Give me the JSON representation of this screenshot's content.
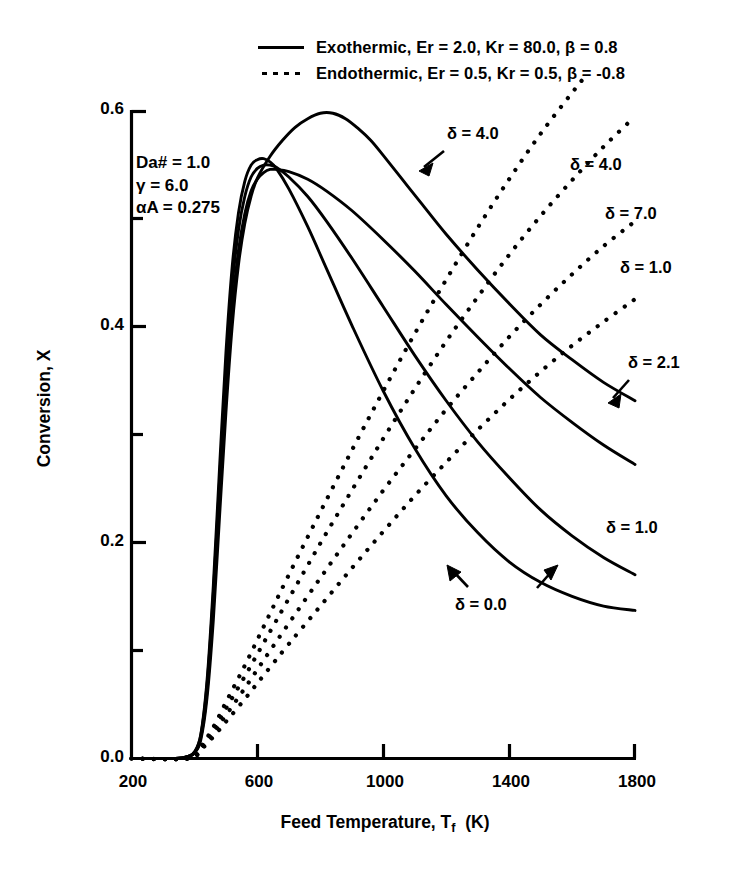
{
  "chart_data": {
    "type": "line",
    "title": "",
    "xlabel": "Feed Temperature, Tf  (K)",
    "ylabel": "Conversion, X",
    "xlim": [
      200,
      1800
    ],
    "ylim": [
      0.0,
      0.6
    ],
    "xticks": [
      200,
      600,
      1000,
      1400,
      1800
    ],
    "xtick_labels": [
      "200",
      "600",
      "1000",
      "1400",
      "1800"
    ],
    "yticks": [
      0.0,
      0.2,
      0.4,
      0.6
    ],
    "ytick_labels": [
      "0.0",
      "0.2",
      "0.4",
      "0.6"
    ],
    "yminor_ticks": [
      0.1,
      0.3,
      0.5
    ],
    "grid": false,
    "legend_position": "above-plot",
    "legend": [
      {
        "style": "solid",
        "label": "Exothermic, Er = 2.0, Kr = 80.0,  β = 0.8"
      },
      {
        "style": "dotted",
        "label": "Endothermic, Er = 0.5, Kr = 0.5, β = -0.8"
      }
    ],
    "annotations": {
      "parameters": [
        "Da# = 1.0",
        "γ = 6.0",
        "αA = 0.275"
      ],
      "curve_labels": [
        {
          "text": "δ = 4.0",
          "series": "exothermic-delta-4.0",
          "arrow": true
        },
        {
          "text": "δ = 4.0",
          "series": "endothermic-delta-4.0",
          "arrow": false
        },
        {
          "text": "δ = 7.0",
          "series": "endothermic-delta-7.0",
          "arrow": false
        },
        {
          "text": "δ = 1.0",
          "series": "endothermic-delta-1.0",
          "arrow": false
        },
        {
          "text": "δ = 2.1",
          "series": "exothermic-delta-2.1",
          "arrow": true
        },
        {
          "text": "δ = 1.0",
          "series": "exothermic-delta-1.0",
          "arrow": false
        },
        {
          "text": "δ = 0.0",
          "series": "delta-0.0",
          "arrow": true
        }
      ]
    },
    "series": [
      {
        "name": "exothermic-delta-0.0",
        "style": "solid",
        "delta": 0.0,
        "points": [
          [
            200,
            0.0
          ],
          [
            340,
            0.0
          ],
          [
            380,
            0.002
          ],
          [
            400,
            0.006
          ],
          [
            420,
            0.022
          ],
          [
            440,
            0.072
          ],
          [
            460,
            0.16
          ],
          [
            480,
            0.27
          ],
          [
            500,
            0.375
          ],
          [
            520,
            0.455
          ],
          [
            540,
            0.505
          ],
          [
            560,
            0.534
          ],
          [
            580,
            0.549
          ],
          [
            600,
            0.554
          ],
          [
            620,
            0.555
          ],
          [
            640,
            0.552
          ],
          [
            660,
            0.546
          ],
          [
            700,
            0.527
          ],
          [
            760,
            0.492
          ],
          [
            820,
            0.453
          ],
          [
            900,
            0.401
          ],
          [
            1000,
            0.34
          ],
          [
            1100,
            0.287
          ],
          [
            1200,
            0.243
          ],
          [
            1300,
            0.209
          ],
          [
            1400,
            0.182
          ],
          [
            1500,
            0.163
          ],
          [
            1600,
            0.15
          ],
          [
            1700,
            0.141
          ],
          [
            1800,
            0.137
          ]
        ]
      },
      {
        "name": "exothermic-delta-1.0",
        "style": "solid",
        "delta": 1.0,
        "points": [
          [
            200,
            0.0
          ],
          [
            340,
            0.0
          ],
          [
            380,
            0.002
          ],
          [
            400,
            0.006
          ],
          [
            420,
            0.021
          ],
          [
            440,
            0.068
          ],
          [
            460,
            0.152
          ],
          [
            480,
            0.258
          ],
          [
            500,
            0.358
          ],
          [
            520,
            0.437
          ],
          [
            540,
            0.489
          ],
          [
            560,
            0.52
          ],
          [
            580,
            0.538
          ],
          [
            600,
            0.546
          ],
          [
            620,
            0.549
          ],
          [
            640,
            0.549
          ],
          [
            660,
            0.547
          ],
          [
            700,
            0.538
          ],
          [
            760,
            0.52
          ],
          [
            820,
            0.497
          ],
          [
            900,
            0.463
          ],
          [
            1000,
            0.418
          ],
          [
            1100,
            0.373
          ],
          [
            1200,
            0.331
          ],
          [
            1300,
            0.293
          ],
          [
            1400,
            0.26
          ],
          [
            1500,
            0.23
          ],
          [
            1600,
            0.206
          ],
          [
            1700,
            0.186
          ],
          [
            1800,
            0.17
          ]
        ]
      },
      {
        "name": "exothermic-delta-2.1",
        "style": "solid",
        "delta": 2.1,
        "points": [
          [
            200,
            0.0
          ],
          [
            340,
            0.0
          ],
          [
            380,
            0.002
          ],
          [
            400,
            0.005
          ],
          [
            420,
            0.019
          ],
          [
            440,
            0.062
          ],
          [
            460,
            0.14
          ],
          [
            480,
            0.24
          ],
          [
            500,
            0.337
          ],
          [
            520,
            0.416
          ],
          [
            540,
            0.47
          ],
          [
            560,
            0.504
          ],
          [
            580,
            0.525
          ],
          [
            600,
            0.536
          ],
          [
            620,
            0.542
          ],
          [
            640,
            0.545
          ],
          [
            660,
            0.545
          ],
          [
            700,
            0.543
          ],
          [
            760,
            0.536
          ],
          [
            820,
            0.525
          ],
          [
            900,
            0.507
          ],
          [
            1000,
            0.48
          ],
          [
            1100,
            0.451
          ],
          [
            1200,
            0.42
          ],
          [
            1300,
            0.39
          ],
          [
            1400,
            0.361
          ],
          [
            1500,
            0.334
          ],
          [
            1600,
            0.311
          ],
          [
            1700,
            0.29
          ],
          [
            1800,
            0.272
          ]
        ]
      },
      {
        "name": "exothermic-delta-4.0",
        "style": "solid",
        "delta": 4.0,
        "points": [
          [
            200,
            0.0
          ],
          [
            340,
            0.0
          ],
          [
            380,
            0.002
          ],
          [
            400,
            0.005
          ],
          [
            420,
            0.017
          ],
          [
            440,
            0.056
          ],
          [
            460,
            0.128
          ],
          [
            480,
            0.225
          ],
          [
            500,
            0.32
          ],
          [
            520,
            0.4
          ],
          [
            540,
            0.457
          ],
          [
            560,
            0.495
          ],
          [
            580,
            0.52
          ],
          [
            600,
            0.537
          ],
          [
            640,
            0.557
          ],
          [
            680,
            0.572
          ],
          [
            720,
            0.584
          ],
          [
            760,
            0.592
          ],
          [
            800,
            0.597
          ],
          [
            840,
            0.597
          ],
          [
            880,
            0.592
          ],
          [
            920,
            0.583
          ],
          [
            960,
            0.572
          ],
          [
            1000,
            0.558
          ],
          [
            1060,
            0.536
          ],
          [
            1120,
            0.514
          ],
          [
            1200,
            0.485
          ],
          [
            1300,
            0.452
          ],
          [
            1400,
            0.421
          ],
          [
            1500,
            0.392
          ],
          [
            1600,
            0.369
          ],
          [
            1700,
            0.348
          ],
          [
            1800,
            0.331
          ]
        ]
      },
      {
        "name": "endothermic-delta-0.0",
        "style": "dotted",
        "delta": 0.0,
        "points": [
          [
            200,
            0.0
          ],
          [
            380,
            0.0
          ],
          [
            420,
            0.008
          ],
          [
            460,
            0.02
          ],
          [
            500,
            0.034
          ],
          [
            560,
            0.055
          ],
          [
            620,
            0.077
          ],
          [
            700,
            0.106
          ],
          [
            800,
            0.141
          ],
          [
            900,
            0.176
          ],
          [
            1000,
            0.21
          ],
          [
            1100,
            0.243
          ],
          [
            1200,
            0.274
          ],
          [
            1300,
            0.304
          ],
          [
            1400,
            0.332
          ],
          [
            1500,
            0.358
          ],
          [
            1600,
            0.382
          ],
          [
            1700,
            0.404
          ],
          [
            1800,
            0.425
          ]
        ]
      },
      {
        "name": "endothermic-delta-1.0",
        "style": "dotted",
        "delta": 1.0,
        "points": [
          [
            200,
            0.0
          ],
          [
            380,
            0.0
          ],
          [
            420,
            0.009
          ],
          [
            460,
            0.023
          ],
          [
            500,
            0.04
          ],
          [
            560,
            0.065
          ],
          [
            620,
            0.091
          ],
          [
            700,
            0.125
          ],
          [
            800,
            0.167
          ],
          [
            900,
            0.208
          ],
          [
            1000,
            0.248
          ],
          [
            1100,
            0.286
          ],
          [
            1200,
            0.323
          ],
          [
            1300,
            0.357
          ],
          [
            1400,
            0.39
          ],
          [
            1500,
            0.42
          ],
          [
            1600,
            0.448
          ],
          [
            1700,
            0.474
          ],
          [
            1800,
            0.497
          ]
        ]
      },
      {
        "name": "endothermic-delta-7.0",
        "style": "dotted",
        "delta": 7.0,
        "points": [
          [
            200,
            0.0
          ],
          [
            380,
            0.0
          ],
          [
            420,
            0.01
          ],
          [
            460,
            0.026
          ],
          [
            500,
            0.046
          ],
          [
            560,
            0.076
          ],
          [
            620,
            0.107
          ],
          [
            700,
            0.148
          ],
          [
            800,
            0.199
          ],
          [
            900,
            0.248
          ],
          [
            1000,
            0.296
          ],
          [
            1100,
            0.342
          ],
          [
            1200,
            0.386
          ],
          [
            1300,
            0.427
          ],
          [
            1400,
            0.466
          ],
          [
            1500,
            0.502
          ],
          [
            1600,
            0.535
          ],
          [
            1700,
            0.566
          ],
          [
            1800,
            0.594
          ]
        ]
      },
      {
        "name": "endothermic-delta-4.0",
        "style": "dotted",
        "delta": 4.0,
        "points": [
          [
            200,
            0.0
          ],
          [
            380,
            0.0
          ],
          [
            420,
            0.011
          ],
          [
            460,
            0.029
          ],
          [
            500,
            0.052
          ],
          [
            560,
            0.086
          ],
          [
            620,
            0.122
          ],
          [
            700,
            0.17
          ],
          [
            800,
            0.228
          ],
          [
            900,
            0.285
          ],
          [
            1000,
            0.34
          ],
          [
            1100,
            0.393
          ],
          [
            1200,
            0.443
          ],
          [
            1300,
            0.491
          ],
          [
            1400,
            0.536
          ],
          [
            1500,
            0.578
          ],
          [
            1600,
            0.616
          ],
          [
            1650,
            0.634
          ]
        ]
      }
    ]
  },
  "axes": {
    "y_ticks": [
      {
        "value": "0.6"
      },
      {
        "value": "0.4"
      },
      {
        "value": "0.2"
      },
      {
        "value": "0.0"
      }
    ],
    "x_ticks": [
      {
        "value": "200"
      },
      {
        "value": "600"
      },
      {
        "value": "1000"
      },
      {
        "value": "1400"
      },
      {
        "value": "1800"
      }
    ],
    "y_title": "Conversion, X",
    "x_title_main": "Feed Temperature, T",
    "x_title_sub": "f",
    "x_title_unit": "(K)"
  },
  "legend": {
    "row1": "Exothermic, Er = 2.0, Kr = 80.0,  β = 0.8",
    "row2": "Endothermic, Er = 0.5, Kr = 0.5, β = -0.8"
  },
  "parameters": {
    "line1": "Da# = 1.0",
    "line2": "γ = 6.0",
    "line3": "αA = 0.275"
  },
  "curve_labels": {
    "exo_4_0": "δ = 4.0",
    "endo_4_0": "δ = 4.0",
    "endo_7_0": "δ = 7.0",
    "endo_1_0": "δ = 1.0",
    "exo_2_1": "δ = 2.1",
    "exo_1_0": "δ = 1.0",
    "delta_0_0": "δ = 0.0"
  },
  "colors": {
    "ink": "#000000",
    "background": "#ffffff"
  }
}
